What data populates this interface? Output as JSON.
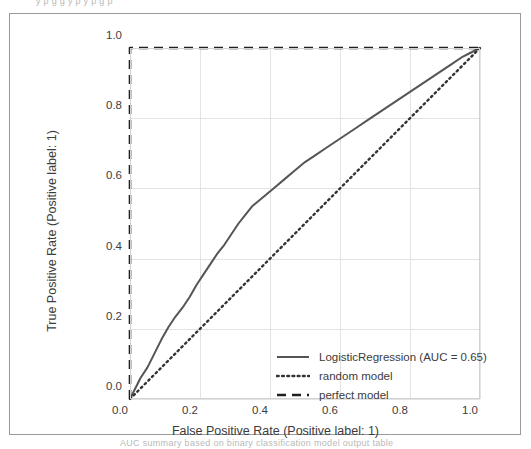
{
  "figure": {
    "top_clipped_text": "y p g g y p y p g p",
    "bottom_clipped_text": "AUC summary based on binary classification model output table"
  },
  "chart_data": {
    "type": "line",
    "title": "",
    "xlabel": "False Positive Rate (Positive label: 1)",
    "ylabel": "True Positive Rate (Positive label: 1)",
    "xlim": [
      0.0,
      1.0
    ],
    "ylim": [
      0.0,
      1.0
    ],
    "xticks": [
      "0.0",
      "0.2",
      "0.4",
      "0.6",
      "0.8",
      "1.0"
    ],
    "yticks": [
      "0.0",
      "0.2",
      "0.4",
      "0.6",
      "0.8",
      "1.0"
    ],
    "xtick_values": [
      0.0,
      0.2,
      0.4,
      0.6,
      0.8,
      1.0
    ],
    "ytick_values": [
      0.0,
      0.2,
      0.4,
      0.6,
      0.8,
      1.0
    ],
    "grid": true,
    "legend_position": "lower right",
    "auc": 0.65,
    "series": [
      {
        "name": "LogisticRegression (AUC = 0.65)",
        "style": "solid",
        "color": "#555555",
        "x": [
          0.0,
          0.01,
          0.02,
          0.03,
          0.05,
          0.07,
          0.09,
          0.11,
          0.13,
          0.15,
          0.17,
          0.19,
          0.21,
          0.23,
          0.25,
          0.27,
          0.29,
          0.31,
          0.33,
          0.35,
          0.38,
          0.41,
          0.44,
          0.47,
          0.5,
          0.53,
          0.56,
          0.59,
          0.62,
          0.65,
          0.68,
          0.71,
          0.74,
          0.77,
          0.8,
          0.83,
          0.86,
          0.89,
          0.92,
          0.95,
          0.97,
          0.99,
          1.0
        ],
        "y": [
          0.0,
          0.02,
          0.04,
          0.06,
          0.09,
          0.13,
          0.17,
          0.205,
          0.235,
          0.26,
          0.29,
          0.325,
          0.355,
          0.385,
          0.415,
          0.44,
          0.47,
          0.5,
          0.525,
          0.55,
          0.575,
          0.6,
          0.625,
          0.65,
          0.675,
          0.695,
          0.715,
          0.735,
          0.755,
          0.775,
          0.795,
          0.815,
          0.835,
          0.855,
          0.875,
          0.895,
          0.915,
          0.935,
          0.955,
          0.975,
          0.985,
          0.995,
          1.0
        ]
      },
      {
        "name": "random model",
        "style": "dotted",
        "color": "#333333",
        "x": [
          0.0,
          1.0
        ],
        "y": [
          0.0,
          1.0
        ]
      },
      {
        "name": "perfect model",
        "style": "dashed",
        "color": "#1f1f1f",
        "x": [
          0.0,
          0.0,
          1.0
        ],
        "y": [
          0.0,
          1.0,
          1.0
        ]
      }
    ],
    "legend": [
      {
        "label": "LogisticRegression (AUC = 0.65)",
        "style": "solid"
      },
      {
        "label": "random model",
        "style": "dotted"
      },
      {
        "label": "perfect model",
        "style": "dashed"
      }
    ]
  }
}
